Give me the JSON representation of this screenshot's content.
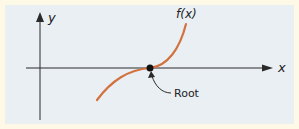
{
  "diagram": {
    "y_axis_label": "y",
    "x_axis_label": "x",
    "curve_label": "f(x)",
    "annotation": "Root",
    "colors": {
      "background_border": "#fdf9e6",
      "panel": "#e9eff3",
      "curve": "#d2733f",
      "axes": "#2a2a2a"
    }
  }
}
